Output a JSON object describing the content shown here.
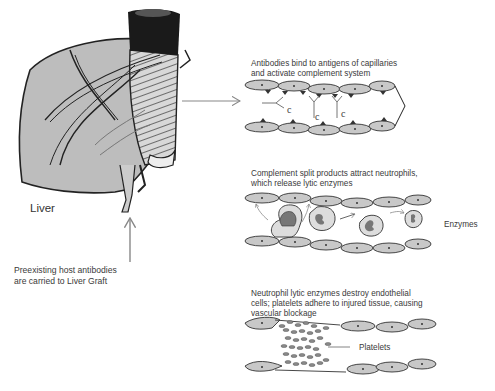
{
  "liver": {
    "label": "Liver",
    "caption_line1": "Preexisting host antibodies",
    "caption_line2": "are carried to Liver Graft"
  },
  "panels": [
    {
      "title_line1": "Antibodies bind to antigens of capillaries",
      "title_line2": "and activate complement system",
      "complement_marks": [
        "c",
        "c",
        "c"
      ]
    },
    {
      "title_line1": "Complement split products attract neutrophils,",
      "title_line2": "which release lytic enzymes",
      "side_label": "Enzymes"
    },
    {
      "title_line1": "Neutrophil lytic enzymes destroy endothelial",
      "title_line2": "cells; platelets adhere to injured tissue, causing",
      "title_line3": "vascular blockage",
      "side_label": "Platelets"
    }
  ],
  "colors": {
    "cell_fill": "#c8c8c8",
    "outline": "#333333",
    "arrow": "#888888",
    "liver_fill": "#bdbdbd"
  }
}
